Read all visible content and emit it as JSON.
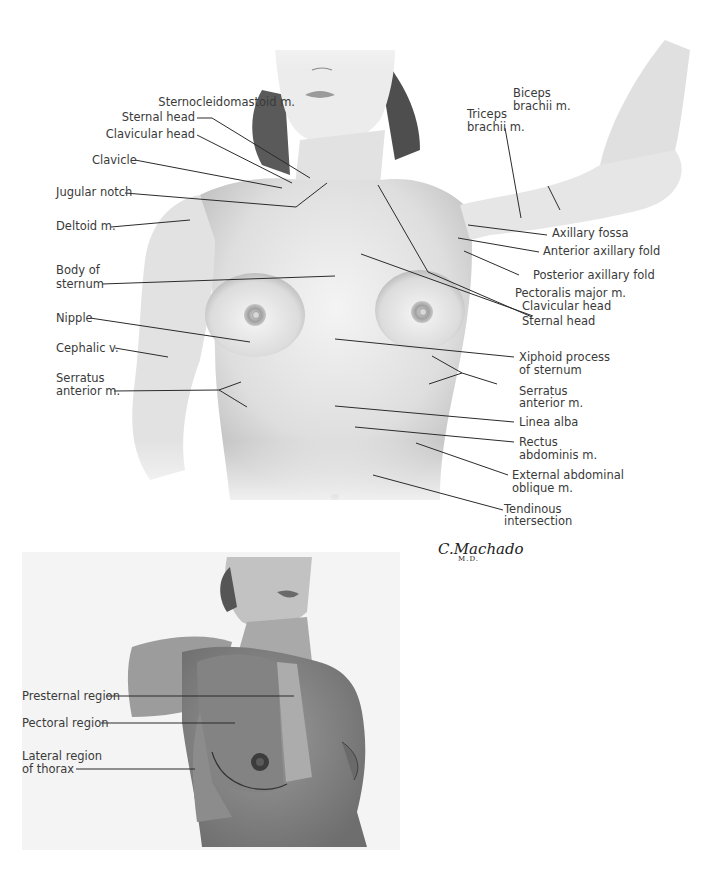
{
  "figure": {
    "signature": "C.Machado",
    "signature_sub": "M.D.",
    "upper_labels_left": [
      {
        "id": "scm",
        "text": "Sternocleidomastoid m."
      },
      {
        "id": "scm_sternal",
        "text": "Sternal head"
      },
      {
        "id": "scm_clavicular",
        "text": "Clavicular head"
      },
      {
        "id": "clavicle",
        "text": "Clavicle"
      },
      {
        "id": "jugular",
        "text": "Jugular notch"
      },
      {
        "id": "deltoid",
        "text": "Deltoid m."
      },
      {
        "id": "body_sternum_1",
        "text": "Body of"
      },
      {
        "id": "body_sternum_2",
        "text": "sternum"
      },
      {
        "id": "nipple",
        "text": "Nipple"
      },
      {
        "id": "cephalic",
        "text": "Cephalic v."
      },
      {
        "id": "serratus_l_1",
        "text": "Serratus"
      },
      {
        "id": "serratus_l_2",
        "text": "anterior m."
      }
    ],
    "upper_labels_right": [
      {
        "id": "biceps_1",
        "text": "Biceps"
      },
      {
        "id": "biceps_2",
        "text": "brachii m."
      },
      {
        "id": "triceps_1",
        "text": "Triceps"
      },
      {
        "id": "triceps_2",
        "text": "brachii m."
      },
      {
        "id": "axillary_fossa",
        "text": "Axillary fossa"
      },
      {
        "id": "ant_axillary",
        "text": "Anterior axillary fold"
      },
      {
        "id": "post_axillary",
        "text": "Posterior axillary fold"
      },
      {
        "id": "pect_major",
        "text": "Pectoralis major m."
      },
      {
        "id": "pect_clav",
        "text": "Clavicular head"
      },
      {
        "id": "pect_stern",
        "text": "Sternal head"
      },
      {
        "id": "xiphoid_1",
        "text": "Xiphoid process"
      },
      {
        "id": "xiphoid_2",
        "text": "of sternum"
      },
      {
        "id": "serratus_r_1",
        "text": "Serratus"
      },
      {
        "id": "serratus_r_2",
        "text": "anterior m."
      },
      {
        "id": "linea_alba",
        "text": "Linea alba"
      },
      {
        "id": "rectus_1",
        "text": "Rectus"
      },
      {
        "id": "rectus_2",
        "text": "abdominis m."
      },
      {
        "id": "ext_oblique_1",
        "text": "External abdominal"
      },
      {
        "id": "ext_oblique_2",
        "text": "oblique m."
      },
      {
        "id": "tendinous_1",
        "text": "Tendinous"
      },
      {
        "id": "tendinous_2",
        "text": "intersection"
      }
    ],
    "lower_panel_labels": [
      {
        "id": "presternal",
        "text": "Presternal region"
      },
      {
        "id": "pectoral",
        "text": "Pectoral region"
      },
      {
        "id": "lateral_1",
        "text": "Lateral region"
      },
      {
        "id": "lateral_2",
        "text": "of thorax"
      }
    ],
    "colors": {
      "background": "#ffffff",
      "skin_light": "#efefef",
      "skin_mid": "#d8d8d8",
      "skin_shadow": "#b5b5b5",
      "hair": "#4a4a4a",
      "leader_line": "#2b2b2b",
      "panel_bg": "#f4f4f4",
      "region_pectoral": "#8f8f8f",
      "region_presternal": "#b0b0b0",
      "region_skin": "#a8a8a8"
    }
  }
}
